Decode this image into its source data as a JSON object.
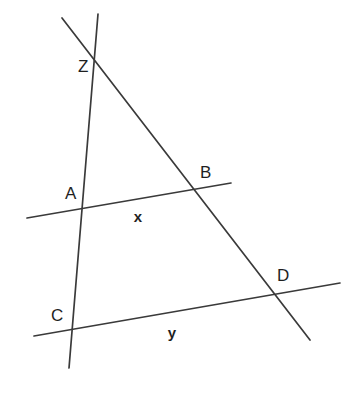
{
  "figure": {
    "background_color": "#ffffff",
    "stroke_color": "#3a3a3a",
    "label_color": "#1f1f1f",
    "width": 359,
    "height": 396
  },
  "chart_data": {
    "type": "diagram",
    "points": [
      {
        "name": "Z",
        "x": 92,
        "y": 61,
        "label_x": 78,
        "label_y": 72
      },
      {
        "name": "A",
        "x": 82,
        "y": 212,
        "label_x": 65,
        "label_y": 199
      },
      {
        "name": "B",
        "x": 194,
        "y": 190,
        "label_x": 200,
        "label_y": 178
      },
      {
        "name": "C",
        "x": 70,
        "y": 333,
        "label_x": 51,
        "label_y": 321
      },
      {
        "name": "D",
        "x": 275,
        "y": 297,
        "label_x": 277,
        "label_y": 281
      }
    ],
    "segment_labels": [
      {
        "name": "x",
        "text": "x",
        "x": 138,
        "y": 222,
        "segment": "AB"
      },
      {
        "name": "y",
        "text": "y",
        "x": 172,
        "y": 338,
        "segment": "CD"
      }
    ],
    "lines": [
      {
        "name": "transversal-ZD",
        "x1": 62,
        "y1": 18,
        "x2": 310,
        "y2": 340,
        "through": [
          "Z",
          "B",
          "D"
        ]
      },
      {
        "name": "transversal-ZC",
        "x1": 98,
        "y1": 14,
        "x2": 69,
        "y2": 368,
        "through": [
          "Z",
          "A",
          "C"
        ]
      },
      {
        "name": "line-AB",
        "x1": 27,
        "y1": 218,
        "x2": 231,
        "y2": 183,
        "through": [
          "A",
          "B"
        ]
      },
      {
        "name": "line-CD",
        "x1": 34,
        "y1": 336,
        "x2": 340,
        "y2": 283,
        "through": [
          "C",
          "D"
        ]
      }
    ]
  }
}
